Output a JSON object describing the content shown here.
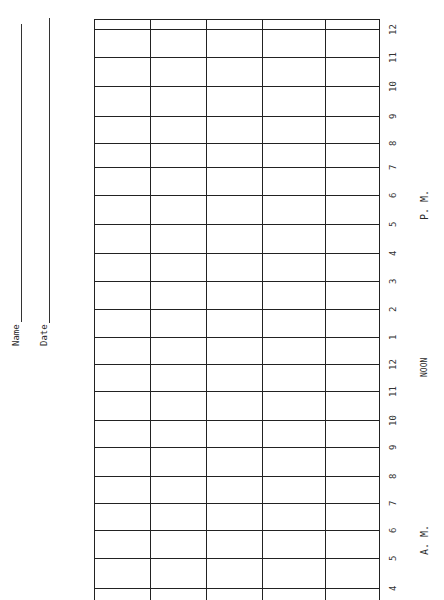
{
  "form": {
    "orientation": "rotated-90-ccw",
    "name_label": "Name",
    "date_label": "Date",
    "pm_label": "P. M.",
    "noon_label": "NOON",
    "am_label": "A. M.",
    "columns": 5,
    "hour_rows": [
      {
        "label": "12",
        "y": 29
      },
      {
        "label": "11",
        "y": 57
      },
      {
        "label": "10",
        "y": 86
      },
      {
        "label": "9",
        "y": 116
      },
      {
        "label": "8",
        "y": 143
      },
      {
        "label": "7",
        "y": 167
      },
      {
        "label": "6",
        "y": 195
      },
      {
        "label": "5",
        "y": 224
      },
      {
        "label": "4",
        "y": 253
      },
      {
        "label": "3",
        "y": 281
      },
      {
        "label": "2",
        "y": 309
      },
      {
        "label": "1",
        "y": 337
      },
      {
        "label": "12",
        "y": 364
      },
      {
        "label": "11",
        "y": 391
      },
      {
        "label": "10",
        "y": 420
      },
      {
        "label": "9",
        "y": 447
      },
      {
        "label": "8",
        "y": 476
      },
      {
        "label": "7",
        "y": 503
      },
      {
        "label": "6",
        "y": 530
      },
      {
        "label": "5",
        "y": 558
      },
      {
        "label": "4",
        "y": 588
      }
    ],
    "column_x": [
      150,
      206,
      262,
      325
    ]
  }
}
